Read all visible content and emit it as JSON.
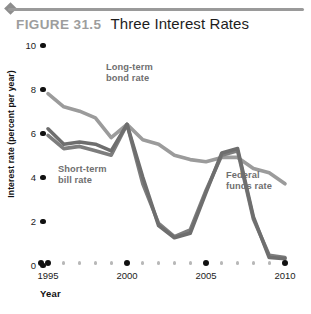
{
  "figure": {
    "label": "FIGURE 31.5",
    "title": "Three Interest Rates"
  },
  "colors": {
    "long_term": "#9b9b9b",
    "short_term_bill": "#7d7d7d",
    "federal_funds": "#6e6e6e",
    "axis_text": "#1c1c1c",
    "series_label": "#6f6f6f",
    "fig_label": "#9d9d9d",
    "rule": "#9a9a9a"
  },
  "chart_data": {
    "type": "line",
    "title": "Three Interest Rates",
    "xlabel": "Year",
    "ylabel": "Interest rate (percent per year)",
    "xlim": [
      1995,
      2010
    ],
    "ylim": [
      0,
      10
    ],
    "yticks": [
      0,
      2,
      4,
      6,
      8,
      10
    ],
    "xticks": [
      1995,
      2000,
      2005,
      2010
    ],
    "xtick_labels": [
      "1995",
      "2000",
      "2005",
      "2010"
    ],
    "ytick_labels": [
      "0",
      "2",
      "4",
      "6",
      "8",
      "10"
    ],
    "grid": false,
    "legend": "inline-annotations",
    "x": [
      1995,
      1996,
      1997,
      1998,
      1999,
      2000,
      2001,
      2002,
      2003,
      2004,
      2005,
      2006,
      2007,
      2008,
      2009,
      2010
    ],
    "series": [
      {
        "name": "Long-term bond rate",
        "color": "#9b9b9b",
        "values": [
          7.7,
          7.1,
          6.9,
          6.6,
          5.7,
          6.3,
          5.6,
          5.4,
          4.9,
          4.7,
          4.6,
          4.8,
          4.8,
          4.3,
          4.1,
          3.6
        ]
      },
      {
        "name": "Short-term bill rate",
        "color": "#7d7d7d",
        "values": [
          5.8,
          5.2,
          5.3,
          5.1,
          4.9,
          6.3,
          3.6,
          1.8,
          1.2,
          1.5,
          3.3,
          4.9,
          5.1,
          2.0,
          0.35,
          0.25
        ]
      },
      {
        "name": "Federal funds rate",
        "color": "#6e6e6e",
        "values": [
          6.1,
          5.4,
          5.5,
          5.4,
          5.1,
          6.3,
          3.9,
          1.7,
          1.15,
          1.35,
          3.2,
          5.0,
          5.2,
          2.1,
          0.25,
          0.2
        ]
      }
    ],
    "annotations": [
      {
        "name": "long-term-bond-rate",
        "text_line1": "Long-term",
        "text_line2": "bond rate"
      },
      {
        "name": "short-term-bill-rate",
        "text_line1": "Short-term",
        "text_line2": "bill rate"
      },
      {
        "name": "federal-funds-rate",
        "text_line1": "Federal",
        "text_line2": "funds rate"
      }
    ]
  }
}
